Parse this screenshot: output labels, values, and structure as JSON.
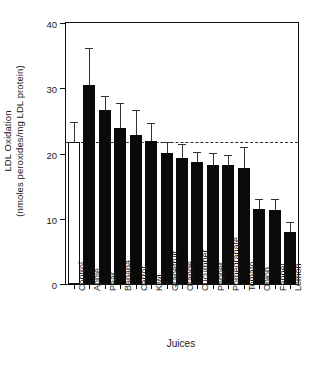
{
  "chart_data": {
    "type": "bar",
    "title": "",
    "xlabel": "Juices",
    "ylabel": "LDL Oxidation (nmoles peroxides/mg LDL protein)",
    "ylabel_line1": "LDL Oxidation",
    "ylabel_line2": "(nmoles peroxides/mg LDL protein)",
    "ylim": [
      0,
      40
    ],
    "yticks": [
      0,
      10,
      20,
      30,
      40
    ],
    "ytick_labels": [
      "0",
      "10",
      "20",
      "30",
      "40"
    ],
    "grid": false,
    "legend": "none",
    "categories": [
      "Control",
      "Apple",
      "Pear",
      "Banana",
      "Carrot",
      "Kiwi",
      "Grapefruit",
      "Orange",
      "Cucumber",
      "Pepper",
      "Pomegranate",
      "Tomato",
      "Onion",
      "Fennel",
      "Lemon"
    ],
    "values": [
      21.8,
      30.5,
      26.6,
      23.9,
      22.8,
      21.9,
      20.1,
      19.3,
      18.7,
      18.3,
      18.2,
      17.8,
      11.5,
      11.4,
      8.0
    ],
    "errors_upper": [
      3.1,
      5.7,
      2.2,
      3.9,
      3.9,
      2.7,
      1.7,
      2.2,
      1.6,
      1.8,
      1.6,
      3.2,
      1.6,
      1.6,
      1.5
    ],
    "bar_styles": [
      "open",
      "filled",
      "filled",
      "filled",
      "filled",
      "filled",
      "filled",
      "filled",
      "filled",
      "filled",
      "filled",
      "filled",
      "filled",
      "filled",
      "filled"
    ],
    "reference_line": {
      "value": 21.8,
      "style": "dashed",
      "label": ""
    },
    "colors": {
      "bar_fill": "#0a0a0a",
      "bar_open_fill": "#ffffff",
      "axis": "#111111",
      "error_bar": "#333333",
      "reference_line": "#2a2a2a",
      "text": "#1a1a1a",
      "background": "#ffffff"
    }
  }
}
